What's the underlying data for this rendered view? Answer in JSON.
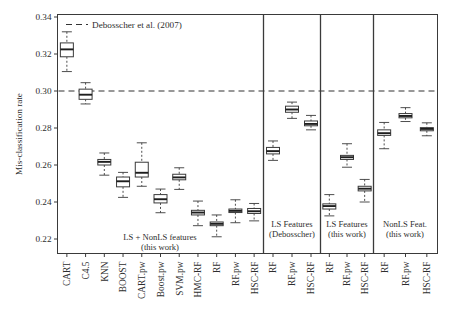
{
  "chart_data": {
    "type": "box",
    "title": "",
    "xlabel": "",
    "ylabel": "Mis-classification rate",
    "ylim": [
      0.208,
      0.345
    ],
    "yticks": [
      0.22,
      0.24,
      0.26,
      0.28,
      0.3,
      0.32,
      0.34
    ],
    "ytick_labels": [
      "0.22",
      "0.24",
      "0.26",
      "0.28",
      "0.30",
      "0.32",
      "0.34"
    ],
    "grid": false,
    "legend_position": "top-left",
    "reference_line": {
      "label": "Debosscher et al. (2007)",
      "value": 0.3,
      "style": "dashed",
      "color": "#333333"
    },
    "categories": [
      "CART",
      "C4.5",
      "KNN",
      "BOOST",
      "CART.pw",
      "Boost.pw",
      "SVM.pw",
      "HMC-RF",
      "RF",
      "RF.pw",
      "HSC-RF",
      "RF",
      "RF.pw",
      "HSC-RF",
      "RF",
      "RF.pw",
      "HSC-RF",
      "RF",
      "RF.pw",
      "HSC-RF"
    ],
    "groups": [
      {
        "label": "LS + NonLS features\n(this work)",
        "line1": "LS + NonLS features",
        "line2": "(this work)",
        "count": 11
      },
      {
        "label": "LS Features\n(Debosscher)",
        "line1": "LS Features",
        "line2": "(Debosscher)",
        "count": 3
      },
      {
        "label": "LS Features\n(this work)",
        "line1": "LS Features",
        "line2": "(this work)",
        "count": 3
      },
      {
        "label": "NonLS Feat.\n(this work)",
        "line1": "NonLS Feat.",
        "line2": "(this work)",
        "count": 3
      }
    ],
    "boxes": [
      {
        "name": "CART",
        "group": 0,
        "whisker_low": 0.3105,
        "q1": 0.3185,
        "median": 0.3225,
        "q3": 0.326,
        "whisker_high": 0.332
      },
      {
        "name": "C4.5",
        "group": 0,
        "whisker_low": 0.293,
        "q1": 0.2955,
        "median": 0.298,
        "q3": 0.301,
        "whisker_high": 0.3045
      },
      {
        "name": "KNN",
        "group": 0,
        "whisker_low": 0.2545,
        "q1": 0.26,
        "median": 0.2617,
        "q3": 0.263,
        "whisker_high": 0.2665
      },
      {
        "name": "BOOST",
        "group": 0,
        "whisker_low": 0.2425,
        "q1": 0.2482,
        "median": 0.2512,
        "q3": 0.2535,
        "whisker_high": 0.256
      },
      {
        "name": "CART.pw",
        "group": 0,
        "whisker_low": 0.2485,
        "q1": 0.2535,
        "median": 0.2558,
        "q3": 0.2615,
        "whisker_high": 0.272
      },
      {
        "name": "Boost.pw",
        "group": 0,
        "whisker_low": 0.2342,
        "q1": 0.2395,
        "median": 0.2415,
        "q3": 0.244,
        "whisker_high": 0.247
      },
      {
        "name": "SVM.pw",
        "group": 0,
        "whisker_low": 0.2468,
        "q1": 0.252,
        "median": 0.2533,
        "q3": 0.255,
        "whisker_high": 0.2585
      },
      {
        "name": "HMC-RF",
        "group": 0,
        "whisker_low": 0.2272,
        "q1": 0.233,
        "median": 0.2343,
        "q3": 0.2355,
        "whisker_high": 0.2405
      },
      {
        "name": "RF",
        "group": 0,
        "whisker_low": 0.2212,
        "q1": 0.2272,
        "median": 0.2282,
        "q3": 0.2292,
        "whisker_high": 0.233
      },
      {
        "name": "RF.pw",
        "group": 0,
        "whisker_low": 0.2288,
        "q1": 0.2343,
        "median": 0.2352,
        "q3": 0.2362,
        "whisker_high": 0.2412
      },
      {
        "name": "HSC-RF",
        "group": 0,
        "whisker_low": 0.2298,
        "q1": 0.2338,
        "median": 0.235,
        "q3": 0.2365,
        "whisker_high": 0.2392
      },
      {
        "name": "RF",
        "group": 1,
        "whisker_low": 0.2625,
        "q1": 0.266,
        "median": 0.2675,
        "q3": 0.2695,
        "whisker_high": 0.273
      },
      {
        "name": "RF.pw",
        "group": 1,
        "whisker_low": 0.2852,
        "q1": 0.2885,
        "median": 0.29,
        "q3": 0.2918,
        "whisker_high": 0.294
      },
      {
        "name": "HSC-RF",
        "group": 1,
        "whisker_low": 0.279,
        "q1": 0.2812,
        "median": 0.2822,
        "q3": 0.2838,
        "whisker_high": 0.2868
      },
      {
        "name": "RF",
        "group": 2,
        "whisker_low": 0.2325,
        "q1": 0.2362,
        "median": 0.2378,
        "q3": 0.239,
        "whisker_high": 0.244
      },
      {
        "name": "RF.pw",
        "group": 2,
        "whisker_low": 0.2588,
        "q1": 0.263,
        "median": 0.2642,
        "q3": 0.2652,
        "whisker_high": 0.2715
      },
      {
        "name": "HSC-RF",
        "group": 2,
        "whisker_low": 0.24,
        "q1": 0.246,
        "median": 0.2472,
        "q3": 0.2485,
        "whisker_high": 0.2522
      },
      {
        "name": "RF",
        "group": 3,
        "whisker_low": 0.2688,
        "q1": 0.276,
        "median": 0.2772,
        "q3": 0.279,
        "whisker_high": 0.283
      },
      {
        "name": "RF.pw",
        "group": 3,
        "whisker_low": 0.2835,
        "q1": 0.2855,
        "median": 0.2865,
        "q3": 0.2878,
        "whisker_high": 0.291
      },
      {
        "name": "HSC-RF",
        "group": 3,
        "whisker_low": 0.2758,
        "q1": 0.2785,
        "median": 0.2795,
        "q3": 0.2802,
        "whisker_high": 0.2828
      }
    ]
  }
}
